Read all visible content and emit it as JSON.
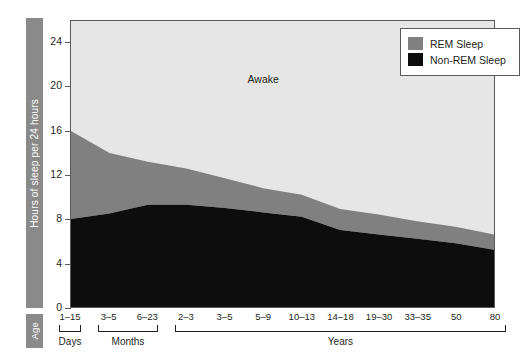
{
  "chart_data": {
    "type": "area",
    "title": "",
    "subtitle": "",
    "xlabel": "Age",
    "ylabel": "Hours of sleep per 24 hours",
    "ylim": [
      0,
      26
    ],
    "yticks": [
      0,
      4,
      8,
      12,
      16,
      20,
      24
    ],
    "ytick_labels": [
      "0",
      "4",
      "8",
      "12",
      "16",
      "20",
      "24"
    ],
    "grid": false,
    "stacked": true,
    "legend_position": "top-right",
    "categories": [
      "1–15",
      "3–5",
      "6–23",
      "2–3",
      "3–5",
      "5–9",
      "10–13",
      "14–18",
      "19–30",
      "33–35",
      "50",
      "80"
    ],
    "category_units": [
      "Days",
      "Months",
      "Months",
      "Years",
      "Years",
      "Years",
      "Years",
      "Years",
      "Years",
      "Years",
      "Years",
      "Years"
    ],
    "series": [
      {
        "name": "Non-REM Sleep",
        "color": "#0d0d0d",
        "values": [
          8.0,
          8.5,
          9.3,
          9.3,
          9.0,
          8.6,
          8.2,
          7.0,
          6.6,
          6.2,
          5.8,
          5.2
        ]
      },
      {
        "name": "REM Sleep",
        "color": "#808080",
        "values": [
          8.0,
          5.5,
          3.9,
          3.3,
          2.7,
          2.2,
          2.0,
          1.9,
          1.8,
          1.6,
          1.5,
          1.4
        ]
      },
      {
        "name": "Awake",
        "color": "#e6e6e6",
        "values": [
          8.0,
          10.0,
          10.8,
          11.4,
          12.3,
          13.2,
          13.8,
          15.1,
          15.6,
          16.2,
          16.7,
          17.4
        ]
      }
    ],
    "total_sleep": [
      16.0,
      14.0,
      13.2,
      12.6,
      11.7,
      10.8,
      10.2,
      8.9,
      8.4,
      7.8,
      7.3,
      6.6
    ],
    "annotations": [
      {
        "text": "Awake",
        "x_category": "5–9",
        "y_value": 20.6
      }
    ],
    "axis_groups": [
      {
        "label": "Days",
        "from_category": "1–15",
        "to_category": "1–15"
      },
      {
        "label": "Months",
        "from_category": "3–5",
        "to_category": "6–23"
      },
      {
        "label": "Years",
        "from_category": "2–3",
        "to_category": "80"
      }
    ]
  },
  "legend": {
    "items": [
      {
        "label": "REM Sleep",
        "color": "#808080"
      },
      {
        "label": "Non-REM Sleep",
        "color": "#0d0d0d"
      }
    ]
  },
  "axis_titles": {
    "y": "Hours of sleep per 24 hours",
    "x": "Age"
  },
  "colors": {
    "awake": "#e6e6e6",
    "rem": "#808080",
    "non_rem": "#0d0d0d",
    "axis": "#58595b",
    "title_bar": "#8a8a8a",
    "text": "#231f20",
    "background": "#ffffff"
  }
}
